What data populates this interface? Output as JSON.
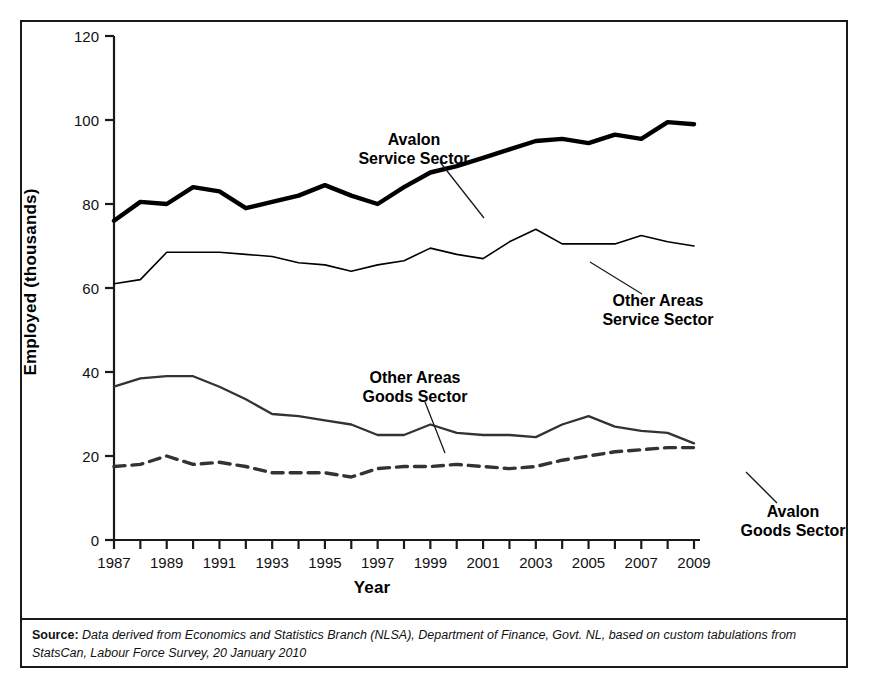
{
  "figure": {
    "source_prefix": "Source:",
    "source_text": "Data derived from Economics and Statistics Branch (NLSA), Department of Finance, Govt. NL, based on custom tabulations from StatsCan, Labour Force Survey, 20 January 2010"
  },
  "chart_data": {
    "type": "line",
    "title": "",
    "xlabel": "Year",
    "ylabel": "Employed (thousands)",
    "xlim": [
      1987,
      2009
    ],
    "ylim": [
      0,
      120
    ],
    "yticks": [
      0,
      20,
      40,
      60,
      80,
      100,
      120
    ],
    "ytick_labels": [
      "0",
      "20",
      "40",
      "60",
      "80",
      "100",
      "120"
    ],
    "x": [
      1987,
      1988,
      1989,
      1990,
      1991,
      1992,
      1993,
      1994,
      1995,
      1996,
      1997,
      1998,
      1999,
      2000,
      2001,
      2002,
      2003,
      2004,
      2005,
      2006,
      2007,
      2008,
      2009
    ],
    "xtick_labels": [
      "1987",
      "",
      "1989",
      "",
      "1991",
      "",
      "1993",
      "",
      "1995",
      "",
      "1997",
      "",
      "1999",
      "",
      "2001",
      "",
      "2003",
      "",
      "2005",
      "",
      "2007",
      "",
      "2009"
    ],
    "grid": false,
    "legend": "annotations",
    "series": [
      {
        "name": "Avalon Service Sector",
        "style": "solid-thick",
        "color": "#000000",
        "values": [
          76,
          80.5,
          80,
          84,
          83,
          79,
          80.5,
          82,
          84.5,
          82,
          80,
          84,
          87.5,
          89,
          91,
          93,
          95,
          95.5,
          94.5,
          96.5,
          95.5,
          99.5,
          99
        ]
      },
      {
        "name": "Other Areas Service Sector",
        "style": "solid-thin",
        "color": "#000000",
        "values": [
          61,
          62,
          68.5,
          68.5,
          68.5,
          68,
          67.5,
          66,
          65.5,
          64,
          65.5,
          66.5,
          69.5,
          68,
          67,
          71,
          74,
          70.5,
          70.5,
          70.5,
          72.5,
          71,
          70
        ]
      },
      {
        "name": "Other Areas Goods Sector",
        "style": "solid-medium",
        "color": "#333333",
        "values": [
          36.5,
          38.5,
          39,
          39,
          36.5,
          33.5,
          30,
          29.5,
          28.5,
          27.5,
          25,
          25,
          27.5,
          25.5,
          25,
          25,
          24.5,
          27.5,
          29.5,
          27,
          26,
          25.5,
          23
        ]
      },
      {
        "name": "Avalon Goods Sector",
        "style": "dashed",
        "color": "#333333",
        "values": [
          17.5,
          18,
          20,
          18,
          18.5,
          17.5,
          16,
          16,
          16,
          15,
          17,
          17.5,
          17.5,
          18,
          17.5,
          17,
          17.5,
          19,
          20,
          21,
          21.5,
          22,
          22
        ]
      }
    ],
    "annotations": [
      {
        "name": "avalon-service-sector",
        "lines": [
          "Avalon",
          "Service Sector"
        ],
        "text_x": 392,
        "text_y": 123,
        "anchor": "middle",
        "leader": {
          "x1": 418,
          "y1": 140,
          "x2": 462,
          "y2": 196
        }
      },
      {
        "name": "other-areas-service-sector",
        "lines": [
          "Other Areas",
          "Service Sector"
        ],
        "text_x": 636,
        "text_y": 284,
        "anchor": "middle",
        "leader": {
          "x1": 620,
          "y1": 272,
          "x2": 568,
          "y2": 240
        }
      },
      {
        "name": "other-areas-goods-sector",
        "lines": [
          "Other Areas",
          "Goods Sector"
        ],
        "text_x": 393,
        "text_y": 361,
        "anchor": "middle",
        "leader": {
          "x1": 403,
          "y1": 380,
          "x2": 423,
          "y2": 431
        }
      },
      {
        "name": "avalon-goods-sector",
        "lines": [
          "Avalon",
          "Goods Sector"
        ],
        "text_x": 771,
        "text_y": 495,
        "anchor": "middle",
        "leader": {
          "x1": 755,
          "y1": 481,
          "x2": 724,
          "y2": 450
        }
      }
    ]
  }
}
